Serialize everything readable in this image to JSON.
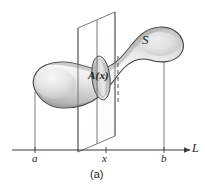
{
  "figure": {
    "caption": "(a)",
    "solid_label": "S",
    "cross_section_label": "A(x)",
    "axis_label": "L",
    "tick_labels": {
      "left": "a",
      "middle": "x",
      "right": "b"
    },
    "colors": {
      "outline": "#3b3b3b",
      "solid_fill_light": "#f2f2f2",
      "solid_fill_mid": "#d9d9d9",
      "solid_fill_dark": "#b3b3b3",
      "plane_stroke": "#555555",
      "axis": "#3b3b3b",
      "cross_section_fill": "#bdbdbd",
      "dashed_line": "#5a5a5a",
      "text": "#1b1b1b"
    },
    "geometry": {
      "axis_y": 150,
      "axis_x_start": 12,
      "axis_x_end": 190,
      "tick_a_x": 35,
      "tick_x_x": 106,
      "tick_b_x": 164
    }
  }
}
